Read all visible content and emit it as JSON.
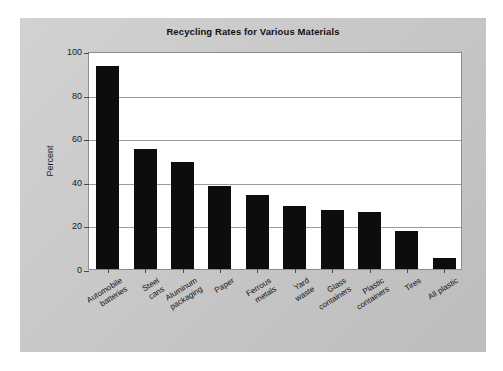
{
  "figure": {
    "background_color": "#c8c8c8",
    "plot_background_color": "#ffffff",
    "bar_color": "#0d0d0d",
    "grid_color": "#9a9a9a"
  },
  "chart_data": {
    "type": "bar",
    "title": "Recycling Rates for Various Materials",
    "xlabel": "",
    "ylabel": "Percent",
    "ylim": [
      0,
      100
    ],
    "yticks": [
      0,
      20,
      40,
      60,
      80,
      100
    ],
    "ytick_labels": [
      "0",
      "20",
      "40",
      "60",
      "80",
      "100"
    ],
    "grid": true,
    "legend": null,
    "categories": [
      "Automobile\nbatteries",
      "Steel\ncans",
      "Aluminum\npackaging",
      "Paper",
      "Ferrous\nmetals",
      "Yard\nwaste",
      "Glass\ncontainers",
      "Plastic\ncontainers",
      "Tires",
      "All plastic"
    ],
    "values": [
      93,
      55,
      49,
      38,
      34,
      29,
      27,
      26,
      17.5,
      5
    ]
  }
}
